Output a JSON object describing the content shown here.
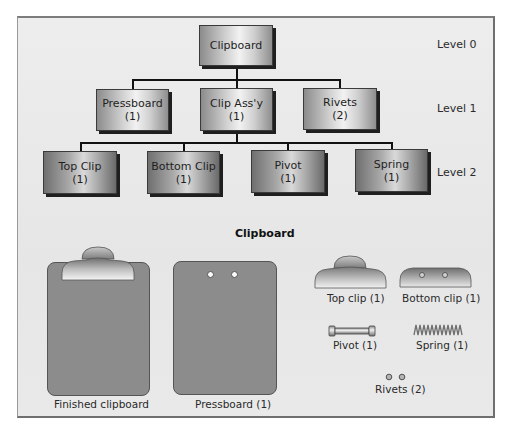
{
  "diagram": {
    "type": "bill-of-materials-tree",
    "levels": [
      {
        "label": "Level 0",
        "nodes": [
          {
            "name": "Clipboard",
            "qty": ""
          }
        ]
      },
      {
        "label": "Level 1",
        "nodes": [
          {
            "name": "Pressboard",
            "qty": "(1)"
          },
          {
            "name": "Clip Ass'y",
            "qty": "(1)"
          },
          {
            "name": "Rivets",
            "qty": "(2)"
          }
        ]
      },
      {
        "label": "Level 2",
        "nodes": [
          {
            "name": "Top Clip",
            "qty": "(1)"
          },
          {
            "name": "Bottom Clip",
            "qty": "(1)"
          },
          {
            "name": "Pivot",
            "qty": "(1)"
          },
          {
            "name": "Spring",
            "qty": "(1)"
          }
        ]
      }
    ],
    "edges": [
      [
        "Clipboard",
        "Pressboard"
      ],
      [
        "Clipboard",
        "Clip Ass'y"
      ],
      [
        "Clipboard",
        "Rivets"
      ],
      [
        "Clip Ass'y",
        "Top Clip"
      ],
      [
        "Clip Ass'y",
        "Bottom Clip"
      ],
      [
        "Clip Ass'y",
        "Pivot"
      ],
      [
        "Clip Ass'y",
        "Spring"
      ]
    ]
  },
  "illustration": {
    "title": "Clipboard",
    "captions": {
      "finished": "Finished clipboard",
      "pressboard": "Pressboard (1)",
      "top_clip": "Top clip (1)",
      "bottom_clip": "Bottom clip (1)",
      "pivot": "Pivot (1)",
      "spring": "Spring (1)",
      "rivets": "Rivets (2)"
    }
  },
  "colors": {
    "board": "#8c8c8c",
    "frame_bg": "#e9e9e9",
    "lines": "#111111"
  }
}
